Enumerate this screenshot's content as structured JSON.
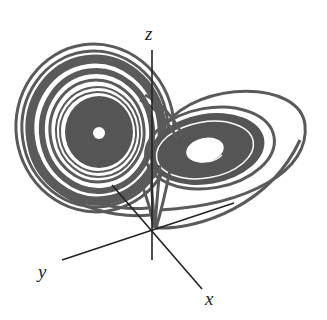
{
  "figure": {
    "axes": {
      "x_label": "x",
      "y_label": "y",
      "z_label": "z"
    },
    "colors": {
      "trajectory": "#5a5a5a",
      "trajectory_dark": "#4a4a4a",
      "axis": "#222222",
      "background": "#ffffff"
    }
  }
}
